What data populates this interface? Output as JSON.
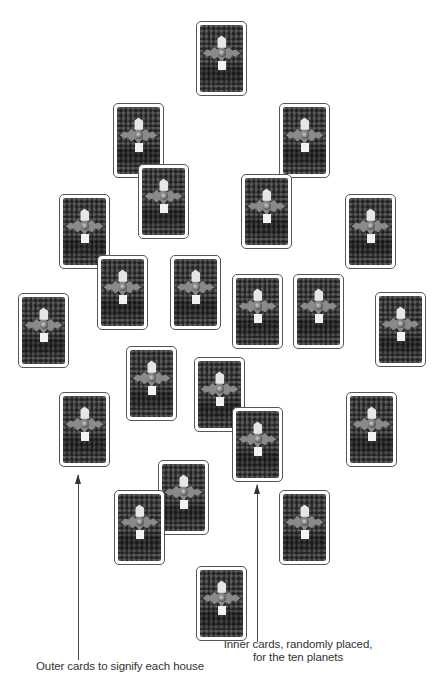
{
  "diagram": {
    "type": "tarot-spread",
    "card_size": {
      "width": 51,
      "height": 75
    },
    "cards": [
      {
        "id": 1,
        "x": 196,
        "y": 21
      },
      {
        "id": 2,
        "x": 113,
        "y": 103
      },
      {
        "id": 3,
        "x": 279,
        "y": 103
      },
      {
        "id": 4,
        "x": 138,
        "y": 164
      },
      {
        "id": 5,
        "x": 241,
        "y": 174
      },
      {
        "id": 6,
        "x": 59,
        "y": 194
      },
      {
        "id": 7,
        "x": 345,
        "y": 194
      },
      {
        "id": 8,
        "x": 97,
        "y": 255
      },
      {
        "id": 9,
        "x": 170,
        "y": 255
      },
      {
        "id": 10,
        "x": 232,
        "y": 274
      },
      {
        "id": 11,
        "x": 293,
        "y": 274
      },
      {
        "id": 12,
        "x": 18,
        "y": 293
      },
      {
        "id": 13,
        "x": 375,
        "y": 292
      },
      {
        "id": 14,
        "x": 126,
        "y": 346
      },
      {
        "id": 15,
        "x": 194,
        "y": 357
      },
      {
        "id": 16,
        "x": 59,
        "y": 392
      },
      {
        "id": 17,
        "x": 346,
        "y": 392
      },
      {
        "id": 18,
        "x": 232,
        "y": 407
      },
      {
        "id": 19,
        "x": 158,
        "y": 460
      },
      {
        "id": 20,
        "x": 114,
        "y": 490
      },
      {
        "id": 21,
        "x": 279,
        "y": 490
      },
      {
        "id": 22,
        "x": 196,
        "y": 566
      }
    ],
    "card_icons": {
      "back_pattern": "patterned-card-back",
      "center_motif": "star-with-emblem"
    },
    "arrows": [
      {
        "name": "outer-cards-arrow",
        "x": 78,
        "y_top": 475,
        "y_bottom": 660
      },
      {
        "name": "inner-cards-arrow",
        "x": 257,
        "y_top": 485,
        "y_bottom": 642
      }
    ],
    "labels": {
      "outer": "Outer cards to signify each house",
      "inner_line1": "Inner cards, randomly placed,",
      "inner_line2": "for the ten planets"
    },
    "colors": {
      "card_border": "#555555",
      "card_back": "#3a3a3a",
      "text": "#333333",
      "arrow": "#444444"
    }
  }
}
